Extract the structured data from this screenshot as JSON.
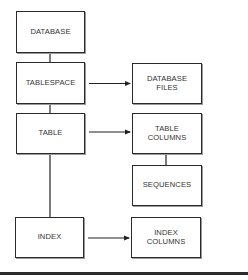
{
  "diagram": {
    "nodes": [
      {
        "id": "database",
        "label": "DATABASE"
      },
      {
        "id": "tablespace",
        "label": "TABLESPACE"
      },
      {
        "id": "table",
        "label": "TABLE"
      },
      {
        "id": "index",
        "label": "INDEX"
      },
      {
        "id": "database_files",
        "label": "DATABASE\nFILES"
      },
      {
        "id": "table_columns",
        "label": "TABLE\nCOLUMNS"
      },
      {
        "id": "sequences",
        "label": "SEQUENCES"
      },
      {
        "id": "index_columns",
        "label": "INDEX\nCOLUMNS"
      }
    ],
    "edges": [
      {
        "from": "database",
        "to": "tablespace",
        "type": "line"
      },
      {
        "from": "tablespace",
        "to": "table",
        "type": "line"
      },
      {
        "from": "table",
        "to": "index",
        "type": "line"
      },
      {
        "from": "tablespace",
        "to": "database_files",
        "type": "arrow"
      },
      {
        "from": "table",
        "to": "table_columns",
        "type": "arrow"
      },
      {
        "from": "table_columns",
        "to": "sequences",
        "type": "line"
      },
      {
        "from": "index",
        "to": "index_columns",
        "type": "arrow"
      }
    ]
  }
}
